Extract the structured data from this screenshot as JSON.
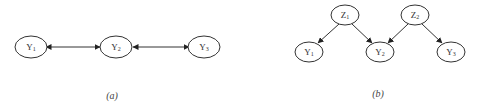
{
  "diagrams": [
    {
      "id": "a",
      "caption": "(a)",
      "nodes": [
        {
          "id": "Y1",
          "label": "Y",
          "sub": "1"
        },
        {
          "id": "Y2",
          "label": "Y",
          "sub": "2"
        },
        {
          "id": "Y3",
          "label": "Y",
          "sub": "3"
        }
      ],
      "edges": [
        {
          "from": "Y1",
          "to": "Y2",
          "type": "bidirected"
        },
        {
          "from": "Y2",
          "to": "Y3",
          "type": "bidirected"
        }
      ]
    },
    {
      "id": "b",
      "caption": "(b)",
      "nodes": [
        {
          "id": "Z1",
          "label": "Z",
          "sub": "1"
        },
        {
          "id": "Z2",
          "label": "Z",
          "sub": "2"
        },
        {
          "id": "Y1",
          "label": "Y",
          "sub": "1"
        },
        {
          "id": "Y2",
          "label": "Y",
          "sub": "2"
        },
        {
          "id": "Y3",
          "label": "Y",
          "sub": "3"
        }
      ],
      "edges": [
        {
          "from": "Z1",
          "to": "Y1",
          "type": "directed"
        },
        {
          "from": "Z1",
          "to": "Y2",
          "type": "directed"
        },
        {
          "from": "Z2",
          "to": "Y2",
          "type": "directed"
        },
        {
          "from": "Z2",
          "to": "Y3",
          "type": "directed"
        }
      ]
    }
  ],
  "colors": {
    "stroke": "#333333",
    "background": "#ffffff"
  }
}
